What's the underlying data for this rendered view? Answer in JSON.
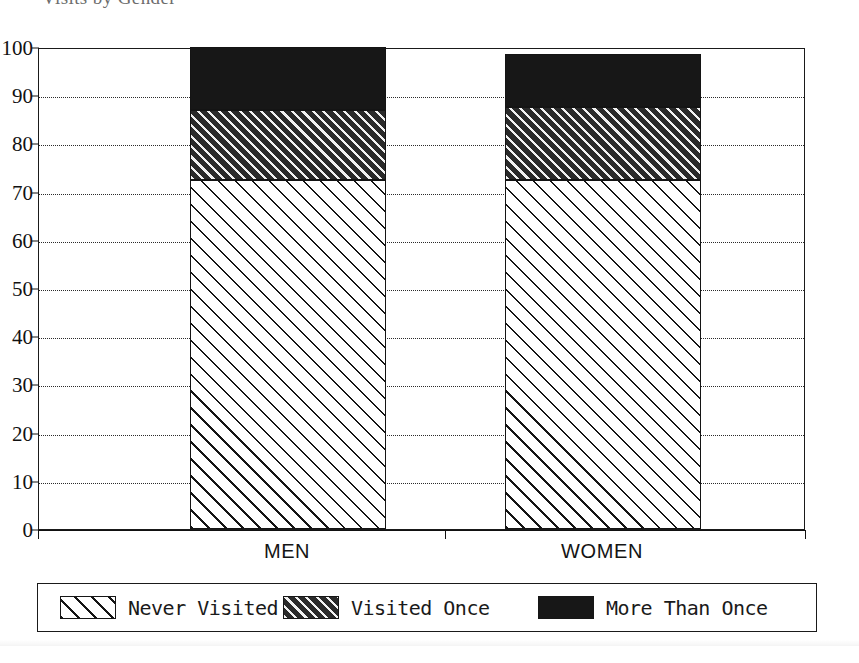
{
  "figure": {
    "title_partial": "Visits by Gender",
    "background_color": "#ffffff",
    "ink_color": "#141414"
  },
  "axes": {
    "y": {
      "label": "",
      "min": 0,
      "max": 100,
      "step": 10,
      "ticks": [
        "100",
        "90",
        "80",
        "70",
        "60",
        "50",
        "40",
        "30",
        "20",
        "10",
        "0"
      ],
      "gridlines": "dotted"
    },
    "x": {
      "label": "",
      "categories": [
        "MEN",
        "WOMEN"
      ]
    }
  },
  "legend": {
    "position": "below-plot",
    "entries": [
      {
        "label": "Never Visited",
        "pattern": "light-diagonal-hatch",
        "color": "#ffffff"
      },
      {
        "label": "Visited Once",
        "pattern": "dark-diagonal-hatch",
        "color": "#2a2a2a"
      },
      {
        "label": "More Than Once",
        "pattern": "solid-black",
        "color": "#171717"
      }
    ]
  },
  "chart_data": {
    "type": "bar",
    "subtype": "stacked",
    "title": "Visits by Gender",
    "xlabel": "",
    "ylabel": "",
    "ylim": [
      0,
      100
    ],
    "ytick_step": 10,
    "grid": true,
    "legend_position": "bottom",
    "categories": [
      "MEN",
      "WOMEN"
    ],
    "series": [
      {
        "name": "Never Visited",
        "values": [
          72.5,
          72.5
        ],
        "pattern": "light-diagonal-hatch",
        "color": "#ffffff"
      },
      {
        "name": "Visited Once",
        "values": [
          14.5,
          15.0
        ],
        "pattern": "dark-diagonal-hatch",
        "color": "#2a2a2a"
      },
      {
        "name": "More Than Once",
        "values": [
          13.0,
          11.0
        ],
        "pattern": "solid-black",
        "color": "#171717"
      }
    ],
    "cumulative_tops": {
      "MEN": {
        "never_visited": 72.5,
        "visited_once": 87.0,
        "more_than_once": 100.0
      },
      "WOMEN": {
        "never_visited": 72.5,
        "visited_once": 87.5,
        "more_than_once": 98.5
      }
    }
  }
}
